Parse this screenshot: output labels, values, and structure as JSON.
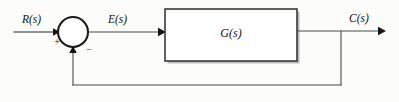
{
  "diagram": {
    "type": "control-block-diagram",
    "background_color": "#fcfcfb",
    "line_color": "#3a3a3a",
    "text_color": "#111111",
    "signals": {
      "input": "R(s)",
      "error": "E(s)",
      "output": "C(s)"
    },
    "blocks": [
      {
        "name": "plant",
        "label": "G(s)",
        "shape": "rectangle",
        "x": 165,
        "y": 9,
        "width": 132,
        "height": 52
      }
    ],
    "summing_junction": {
      "name": "summing-junction",
      "shape": "circle",
      "cx": 73,
      "cy": 32,
      "r": 15,
      "input_sign": "+",
      "feedback_sign": "−"
    },
    "connections": [
      {
        "name": "input-to-sum",
        "from": "R(s)",
        "to": "summing-junction",
        "label": "R(s)",
        "arrow": true
      },
      {
        "name": "sum-to-plant",
        "from": "summing-junction",
        "to": "G(s)",
        "label": "E(s)",
        "arrow": true
      },
      {
        "name": "plant-to-output",
        "from": "G(s)",
        "to": "C(s)",
        "label": "C(s)",
        "arrow": true
      },
      {
        "name": "feedback-path",
        "from": "C(s)",
        "to": "summing-junction",
        "label": "",
        "arrow": true,
        "unity_gain": true
      }
    ]
  }
}
